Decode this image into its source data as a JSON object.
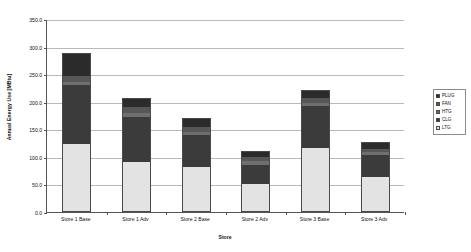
{
  "chart_data": {
    "type": "bar",
    "stacked": true,
    "title": "",
    "xlabel": "Store",
    "ylabel": "Annual Energy Use [MBtu]",
    "categories": [
      "Store 1 Base",
      "Store 1 Adv",
      "Store 2 Base",
      "Store 2 Adv",
      "Store 3 Base",
      "Store 3 Adv"
    ],
    "series": [
      {
        "name": "LTG",
        "color": "#e3e3e3",
        "values": [
          123,
          90,
          82,
          50,
          116,
          63
        ]
      },
      {
        "name": "CLG",
        "color": "#3b3b3b",
        "values": [
          107,
          83,
          57,
          36,
          76,
          40
        ]
      },
      {
        "name": "HTG",
        "color": "#6f6f6f",
        "values": [
          5,
          6,
          7,
          6,
          6,
          5
        ]
      },
      {
        "name": "FAN",
        "color": "#575757",
        "values": [
          12,
          11,
          8,
          7,
          9,
          6
        ]
      },
      {
        "name": "PLUG",
        "color": "#2b2b2b",
        "values": [
          41,
          16,
          17,
          11,
          15,
          13
        ]
      }
    ],
    "totals": [
      288,
      206,
      171,
      110,
      222,
      127
    ],
    "ylim": [
      0,
      350
    ],
    "ytick_step": 50,
    "ytick_labels": [
      "0.0",
      "50.0",
      "100.0",
      "150.0",
      "200.0",
      "250.0",
      "300.0",
      "350.0"
    ],
    "grid": true,
    "legend_position": "right",
    "legend_order_top_to_bottom": [
      "PLUG",
      "FAN",
      "HTG",
      "CLG",
      "LTG"
    ]
  }
}
